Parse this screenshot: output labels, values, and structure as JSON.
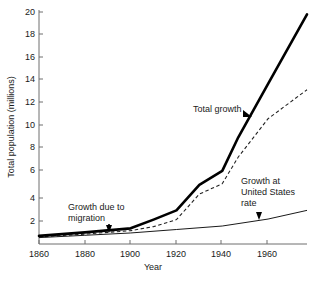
{
  "chart_data": {
    "type": "line",
    "title": "",
    "xlabel": "Year",
    "ylabel": "Total population (millions)",
    "xlim": [
      1860,
      1977
    ],
    "ylim": [
      0,
      20
    ],
    "xticks": [
      1860,
      1880,
      1900,
      1920,
      1940,
      1960
    ],
    "yticks": [
      0,
      2,
      4,
      6,
      8,
      10,
      12,
      14,
      16,
      18,
      20
    ],
    "ytick_labels": [
      "",
      "2",
      "4",
      "6",
      "8",
      "10",
      "12",
      "14",
      "16",
      "18",
      "20"
    ],
    "grid": false,
    "legend": "none",
    "series": [
      {
        "name": "Total growth",
        "style": "solid-thick",
        "color": "#000000",
        "x": [
          1860,
          1880,
          1900,
          1910,
          1920,
          1930,
          1940,
          1947,
          1960,
          1977
        ],
        "values": [
          0.7,
          1.0,
          1.35,
          2.1,
          2.9,
          5.1,
          6.3,
          9.2,
          13.8,
          19.8
        ]
      },
      {
        "name": "Growth due to migration",
        "style": "dashed",
        "color": "#222222",
        "x": [
          1860,
          1880,
          1900,
          1910,
          1920,
          1930,
          1940,
          1947,
          1960,
          1977
        ],
        "values": [
          0.6,
          0.85,
          1.15,
          1.5,
          2.1,
          4.3,
          5.2,
          7.5,
          10.8,
          13.3
        ]
      },
      {
        "name": "Growth at United States rate",
        "style": "solid-thin",
        "color": "#000000",
        "x": [
          1860,
          1880,
          1900,
          1920,
          1940,
          1960,
          1977
        ],
        "values": [
          0.55,
          0.75,
          0.95,
          1.25,
          1.55,
          2.15,
          2.9
        ]
      }
    ],
    "annotations": [
      {
        "label": "Total growth",
        "lines": [
          "Total growth"
        ],
        "target": "total-growth-line",
        "marker": "arrow-right"
      },
      {
        "label": "Growth due to migration",
        "lines": [
          "Growth due to",
          "migration"
        ],
        "target": "migration-line",
        "marker": "arrow-down"
      },
      {
        "label": "Growth at United States rate",
        "lines": [
          "Growth at",
          "United States",
          "rate"
        ],
        "target": "us-rate-line",
        "marker": "arrow-down"
      }
    ]
  },
  "axes": {
    "x_title": "Year",
    "y_title": "Total population (millions)",
    "x_tick_labels": [
      "1860",
      "1880",
      "1900",
      "1920",
      "1940",
      "1960"
    ],
    "y_tick_labels": [
      "20",
      "18",
      "16",
      "14",
      "12",
      "10",
      "8",
      "6",
      "4",
      "2"
    ]
  },
  "annotations": {
    "total_growth": "Total growth",
    "migration_line1": "Growth due to",
    "migration_line2": "migration",
    "us_rate_line1": "Growth at",
    "us_rate_line2": "United States",
    "us_rate_line3": "rate"
  },
  "colors": {
    "axis": "#6e6e6e",
    "text": "#1a1a1a",
    "total_growth": "#000000",
    "migration": "#222222",
    "us_rate": "#000000",
    "background": "#ffffff"
  }
}
